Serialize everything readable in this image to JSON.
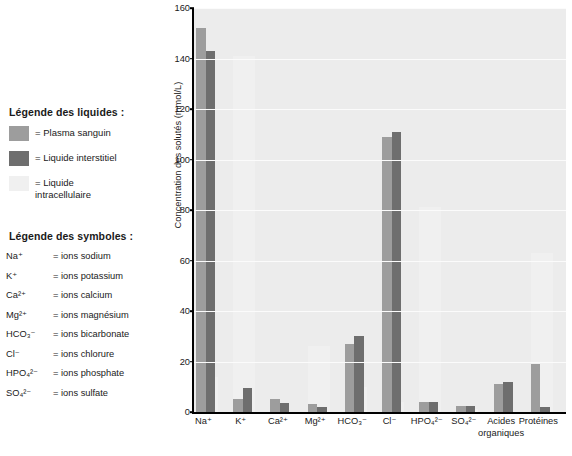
{
  "legend": {
    "liquids_title": "Légende des liquides :",
    "symbols_title": "Légende des symboles :",
    "liquids": [
      {
        "label": "= Plasma sanguin",
        "color": "#9d9d9d"
      },
      {
        "label": "= Liquide interstitiel",
        "color": "#6e6e6e"
      },
      {
        "label": "= Liquide\nintracellulaire",
        "color": "#f0f0f0"
      }
    ],
    "symbols": [
      {
        "key": "Na⁺",
        "value": "= ions sodium"
      },
      {
        "key": "K⁺",
        "value": "= ions potassium"
      },
      {
        "key": "Ca²⁺",
        "value": "= ions calcium"
      },
      {
        "key": "Mg²⁺",
        "value": "= ions magnésium"
      },
      {
        "key": "HCO₃⁻",
        "value": "= ions bicarbonate"
      },
      {
        "key": "Cl⁻",
        "value": "= ions chlorure"
      },
      {
        "key": "HPO₄²⁻",
        "value": "= ions phosphate"
      },
      {
        "key": "SO₄²⁻",
        "value": "= ions sulfate"
      }
    ]
  },
  "chart_data": {
    "type": "bar",
    "title": "",
    "xlabel": "",
    "ylabel": "Concentration des solutés (mmol/L)",
    "ylim": [
      0,
      160
    ],
    "yticks": [
      0,
      20,
      40,
      60,
      80,
      100,
      120,
      140,
      160
    ],
    "grid": true,
    "legend_position": "left-panel",
    "categories": [
      "Na⁺",
      "K⁺",
      "Ca²⁺",
      "Mg²⁺",
      "HCO₃⁻",
      "Cl⁻",
      "HPO₄²⁻",
      "SO₄²⁻",
      "Acides organiques",
      "Protéines"
    ],
    "category_lines": [
      [
        "Na⁺"
      ],
      [
        "K⁺"
      ],
      [
        "Ca²⁺"
      ],
      [
        "Mg²⁺"
      ],
      [
        "HCO₃⁻"
      ],
      [
        "Cl⁻"
      ],
      [
        "HPO₄²⁻"
      ],
      [
        "SO₄²⁻"
      ],
      [
        "Acides",
        "organiques"
      ],
      [
        "Protéines"
      ]
    ],
    "series": [
      {
        "name": "Plasma sanguin",
        "color": "#9d9d9d",
        "values": [
          152,
          5,
          5,
          3,
          27,
          109,
          4,
          2.5,
          11,
          19
        ]
      },
      {
        "name": "Liquide interstitiel",
        "color": "#6e6e6e",
        "values": [
          143,
          9.5,
          3.5,
          2,
          30,
          111,
          4,
          2.5,
          12,
          2
        ]
      },
      {
        "name": "Liquide intracellulaire",
        "color": "#f0f0f0",
        "values": [
          14,
          141,
          0,
          26,
          10,
          4,
          81,
          1,
          0,
          63
        ]
      }
    ]
  },
  "colors": {
    "plot_background": "#ececec",
    "gridline": "#fbfbfb",
    "axis": "#000000",
    "plasma": "#9d9d9d",
    "interstitial": "#6e6e6e",
    "intracellular": "#f0f0f0"
  }
}
